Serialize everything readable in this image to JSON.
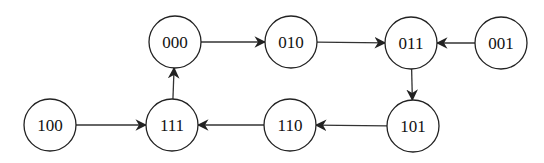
{
  "diagram": {
    "type": "state-transition-graph",
    "nodes": [
      {
        "id": "000",
        "label": "000",
        "x": 175,
        "y": 42
      },
      {
        "id": "010",
        "label": "010",
        "x": 291,
        "y": 42
      },
      {
        "id": "011",
        "label": "011",
        "x": 411,
        "y": 43
      },
      {
        "id": "001",
        "label": "001",
        "x": 501,
        "y": 43
      },
      {
        "id": "100",
        "label": "100",
        "x": 50,
        "y": 125
      },
      {
        "id": "111",
        "label": "111",
        "x": 172,
        "y": 125
      },
      {
        "id": "110",
        "label": "110",
        "x": 290,
        "y": 125
      },
      {
        "id": "101",
        "label": "101",
        "x": 413,
        "y": 126
      }
    ],
    "edges": [
      {
        "from": "000",
        "to": "010"
      },
      {
        "from": "010",
        "to": "011"
      },
      {
        "from": "001",
        "to": "011"
      },
      {
        "from": "011",
        "to": "101"
      },
      {
        "from": "101",
        "to": "110"
      },
      {
        "from": "110",
        "to": "111"
      },
      {
        "from": "100",
        "to": "111"
      },
      {
        "from": "111",
        "to": "000"
      }
    ]
  }
}
